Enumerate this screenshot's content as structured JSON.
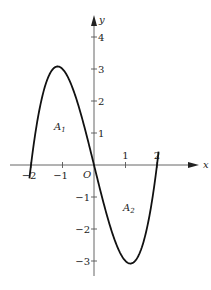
{
  "figure": {
    "function": "y = x^3 - 4x",
    "x_axis": {
      "label": "x",
      "ticks": [
        -2,
        -1,
        1,
        2
      ],
      "tick_labels": [
        "−2",
        "−1",
        "1",
        "2"
      ]
    },
    "y_axis": {
      "label": "y",
      "ticks": [
        4,
        3,
        2,
        1,
        -1,
        -2,
        -3
      ],
      "tick_labels": [
        "4",
        "3",
        "2",
        "1",
        "−1",
        "−2",
        "−3"
      ]
    },
    "origin_label": "O",
    "regions": [
      {
        "name": "A",
        "sub": "1",
        "description": "area between curve and x-axis on [-2,0]"
      },
      {
        "name": "A",
        "sub": "2",
        "description": "area between curve and x-axis on [0,2]"
      }
    ],
    "extrema": [
      {
        "type": "max",
        "x": -1.155,
        "y": 3.08
      },
      {
        "type": "min",
        "x": 1.155,
        "y": -3.08
      }
    ],
    "roots": [
      -2,
      0,
      2
    ],
    "colors": {
      "curve": "#111111",
      "axis": "#555555",
      "text": "#222222"
    }
  }
}
